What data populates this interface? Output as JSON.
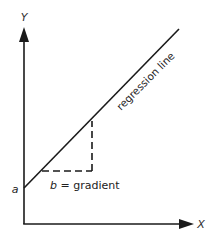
{
  "diagram": {
    "type": "linear-regression-schematic",
    "colors": {
      "ink": "#1a1a1a",
      "background": "#ffffff"
    },
    "axes": {
      "x_label": "X",
      "y_label": "Y"
    },
    "labels": {
      "intercept": "a",
      "gradient_symbol": "b",
      "gradient_text": " = gradient",
      "regression_line": "regression line"
    },
    "geometry": {
      "origin": [
        24,
        224
      ],
      "y_axis_top": [
        24,
        28
      ],
      "x_axis_right": [
        193,
        224
      ],
      "regression_start": [
        24,
        188
      ],
      "regression_end": [
        179,
        29
      ],
      "dashed_corner": [
        92,
        171
      ],
      "dashed_h_start": [
        42,
        171
      ],
      "dashed_v_top": [
        92,
        121
      ]
    }
  }
}
